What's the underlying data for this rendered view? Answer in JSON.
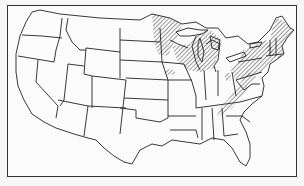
{
  "map": {
    "subject": "contiguous-united-states",
    "style": "black-and-white outline map with state borders",
    "shaded_regions_pattern": "diagonal hatching",
    "shaded_regions": [
      "maine",
      "new-hampshire",
      "vermont",
      "massachusetts",
      "connecticut",
      "rhode-island",
      "new-york",
      "pennsylvania",
      "new-jersey",
      "northern-minnesota",
      "wisconsin",
      "michigan",
      "northern-ohio",
      "appalachian-belt-west-virginia-virginia-to-north-carolina",
      "small-patch-iowa",
      "small-patch-illinois-indiana"
    ],
    "colors": {
      "outline": "#222222",
      "hatch": "#555555",
      "background": "#fbfbfb"
    }
  }
}
